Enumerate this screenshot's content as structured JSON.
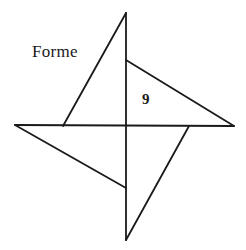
{
  "figure": {
    "name": "forme-pinwheel-figure",
    "width": 246,
    "height": 250,
    "background_color": "#ffffff",
    "stroke_color": "#1a1a1a",
    "stroke_width": 1.8,
    "labels": {
      "forme": "Forme",
      "nine": "9"
    },
    "geometry": {
      "description": "Four-bladed pinwheel / star formed by four congruent right triangles rotated 90 degrees about a common center, overlaid on a horizontal and a vertical axis line.",
      "center": [
        126,
        126
      ],
      "outer_points": {
        "top": [
          126,
          13
        ],
        "right": [
          234,
          126
        ],
        "bottom": [
          126,
          240
        ],
        "left": [
          15,
          125
        ]
      },
      "inner_points": {
        "top": [
          126,
          60
        ],
        "right": [
          189,
          126
        ],
        "bottom": [
          126,
          188
        ],
        "left": [
          63,
          126
        ]
      },
      "axis_lines": [
        {
          "name": "vertical-axis",
          "from": [
            126,
            13
          ],
          "to": [
            126,
            240
          ]
        },
        {
          "name": "horizontal-axis",
          "from": [
            15,
            125
          ],
          "to": [
            234,
            126
          ]
        }
      ],
      "blades": [
        {
          "name": "blade-upper-left",
          "points": [
            [
              126,
              13
            ],
            [
              63,
              126
            ],
            [
              126,
              126
            ]
          ]
        },
        {
          "name": "blade-upper-right",
          "points": [
            [
              126,
              60
            ],
            [
              234,
              126
            ],
            [
              126,
              126
            ]
          ]
        },
        {
          "name": "blade-lower-right",
          "points": [
            [
              189,
              126
            ],
            [
              126,
              240
            ],
            [
              126,
              126
            ]
          ]
        },
        {
          "name": "blade-lower-left",
          "points": [
            [
              15,
              125
            ],
            [
              126,
              188
            ],
            [
              126,
              126
            ]
          ]
        }
      ]
    }
  }
}
